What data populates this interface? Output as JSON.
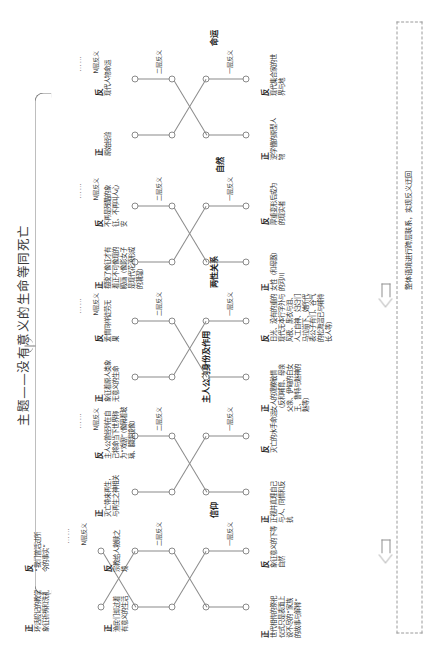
{
  "title": {
    "prefix": "主题",
    "dash": "——",
    "text": "没有意义的生命等同死亡",
    "full": "主题——没有意义的生命等同死亡"
  },
  "levels": {
    "l1": "一层反义",
    "l2": "二层反义",
    "ln": "N层反义",
    "dots": "……"
  },
  "polarity": {
    "positive": "正",
    "negative": "反"
  },
  "feedback": {
    "label": "整体语境进行跨层联系，实现反义迂回",
    "arrow_icon": "left-arrow-icon"
  },
  "branches": [
    {
      "category": "信仰",
      "level1": {
        "positive": "世代相传的祭祀仪式只是表面上说不尽的“家族的故事与解释”",
        "negative": "象征意义的下等自然"
      },
      "level2": {
        "positive": "渔民们却过着有意义的生活",
        "negative": "宗教给人救赎之境"
      },
      "leveln": {
        "positive": "环话般记的教堂象征祈祷和洗礼",
        "negative": "“我们曾活过所今的事实”"
      }
    },
    {
      "category": "主人公的身份及作用",
      "level1": {
        "positive": "正视并真理自己与人、同情和反抗",
        "negative": "灭亡的水手命运"
      },
      "level2": {
        "positive": "灭亡带来再生，与再生之神相关",
        "negative": "主人公曾经列在自己将命当下世界称为“戏剧”（像隔着玻璃、朦胧镜像）"
      },
      "leveln": {
        "positive": "",
        "negative": ""
      }
    },
    {
      "category": "两性关系",
      "level1": {
        "positive": "女人的观察敏情（反和哺育、母亲父亲、伊甸的白女王、鲁特与魅神的魅等）",
        "negative": "日光、没有的重的现代无本行字外与风夜、黑衣与泪、人工自神、妇妇们马拉崩下、她所代表公子有们、谷气的松海温已与哺待长人等）"
      },
      "level2": {
        "positive": "象征着原人类象无意义的生命",
        "negative": "爱情同样徒劳无果"
      },
      "leveln": {
        "positive": "",
        "negative": ""
      }
    },
    {
      "category": "自然",
      "level1": {
        "positive": "女性（和母器）的河川",
        "negative": "厚重变形后成为的现实者"
      },
      "level2": {
        "positive": "摆脱了像征才有着正不可像现的殿画（像影女子是现代花源形成的潮湿）",
        "negative": "不再是残酷的象征、不再叫人心安"
      },
      "leveln": {
        "positive": "",
        "negative": ""
      }
    },
    {
      "category": "命运",
      "level1": {
        "positive": "逆学懂的原型人物",
        "negative": "现代集合家的世界与地"
      },
      "level2": {
        "positive": "原始经验",
        "negative": "现代人物命运"
      },
      "leveln": {
        "positive": "",
        "negative": ""
      }
    }
  ]
}
